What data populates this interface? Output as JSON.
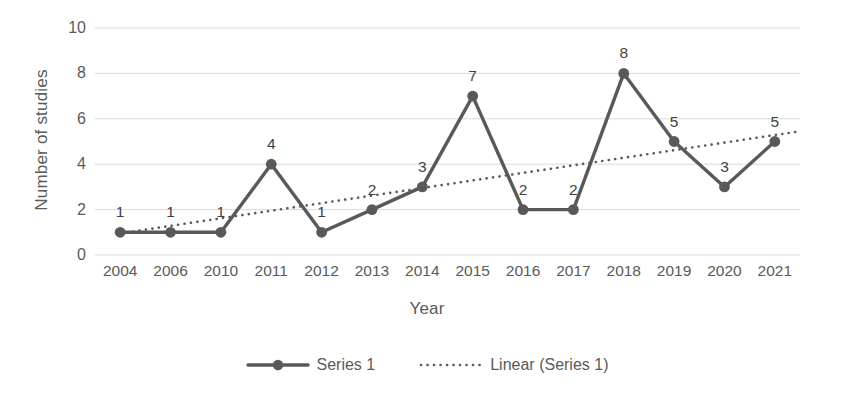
{
  "chart_data": {
    "type": "line",
    "title": "",
    "xlabel": "Year",
    "ylabel": "Number of studies",
    "categories": [
      "2004",
      "2006",
      "2010",
      "2011",
      "2012",
      "2013",
      "2014",
      "2015",
      "2016",
      "2017",
      "2018",
      "2019",
      "2020",
      "2021"
    ],
    "series": [
      {
        "name": "Series 1",
        "values": [
          1,
          1,
          1,
          4,
          1,
          2,
          3,
          7,
          2,
          2,
          8,
          5,
          3,
          5
        ],
        "marker": "circle",
        "color": "#595959"
      },
      {
        "name": "Linear (Series 1)",
        "type": "trendline",
        "style": "dotted",
        "color": "#595959",
        "endpoints": [
          0.95,
          5.45
        ]
      }
    ],
    "data_labels": [
      "1",
      "1",
      "1",
      "4",
      "1",
      "2",
      "3",
      "7",
      "2",
      "2",
      "8",
      "5",
      "3",
      "5"
    ],
    "ylim": [
      0,
      10
    ],
    "y_ticks": [
      "0",
      "2",
      "4",
      "6",
      "8",
      "10"
    ],
    "grid": "horizontal",
    "legend_position": "bottom"
  },
  "legend": {
    "items": [
      {
        "label": "Series 1",
        "key": "line-marker"
      },
      {
        "label": "Linear (Series 1)",
        "key": "dotted-line"
      }
    ]
  },
  "colors": {
    "series": "#595959",
    "grid": "#d9d9d9",
    "text": "#5a5a5a"
  }
}
